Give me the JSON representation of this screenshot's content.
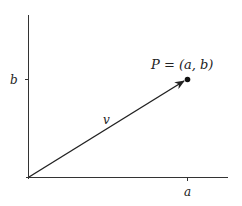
{
  "diagram": {
    "type": "vector-in-plane",
    "point_label": "P = (a, b)",
    "vector_label": "v",
    "x_tick_label": "a",
    "y_tick_label": "b",
    "colors": {
      "axis": "#333333",
      "vector": "#222222",
      "point": "#111111"
    }
  }
}
